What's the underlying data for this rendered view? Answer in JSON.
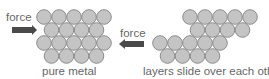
{
  "labels": {
    "force_left": "force",
    "force_right": "force",
    "caption_left": "pure metal",
    "caption_right": "layers slide over each other"
  },
  "colors": {
    "atom_fill": "#c4c4c4",
    "atom_stroke": "#8c8c8c",
    "arrow": "#4a4a4a"
  },
  "diagram": {
    "left_cluster_rows": [
      5,
      4,
      5,
      4
    ],
    "right_cluster_rows": [
      5,
      4,
      5,
      4
    ]
  }
}
